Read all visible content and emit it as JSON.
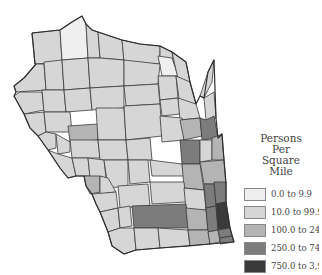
{
  "legend": {
    "title_line1": "Persons Per",
    "title_line2": "Square Mile",
    "items": [
      {
        "label": "0.0 to 9.9",
        "color": "#efefef"
      },
      {
        "label": "10.0 to 99.9",
        "color": "#d6d6d6"
      },
      {
        "label": "100.0 to 249.9",
        "color": "#b4b4b4"
      },
      {
        "label": "250.0 to 749.9",
        "color": "#7c7c7c"
      },
      {
        "label": "750.0 to 3,9",
        "color": "#3a3a3a"
      }
    ]
  },
  "map": {
    "region": "Wisconsin",
    "subject": "Population density by county",
    "colors": {
      "c0": "#efefef",
      "c1": "#d6d6d6",
      "c2": "#b4b4b4",
      "c3": "#7c7c7c",
      "c4": "#3a3a3a"
    }
  }
}
